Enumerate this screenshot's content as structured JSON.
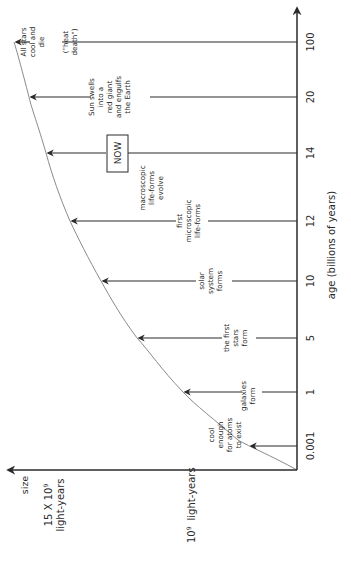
{
  "diagram": {
    "orientation": "rotated-90-ccw",
    "x_axis": {
      "label": "age (billions of years)",
      "ticks": [
        "0.001",
        "1",
        "5",
        "10",
        "12",
        "14",
        "20",
        "100"
      ]
    },
    "y_axis": {
      "label": "size",
      "markers": [
        "15 X 10⁹ light-years",
        "10⁹ light-years"
      ]
    },
    "events": [
      {
        "age": "0.001",
        "lines": [
          "cool",
          "enough",
          "for atoms",
          "to exist"
        ]
      },
      {
        "age": "1",
        "lines": [
          "galaxies",
          "form"
        ]
      },
      {
        "age": "5",
        "lines": [
          "the first",
          "stars",
          "form"
        ]
      },
      {
        "age": "10",
        "lines": [
          "solar",
          "system",
          "forms"
        ]
      },
      {
        "age": "12",
        "lines": [
          "first",
          "microscopic",
          "life-forms"
        ]
      },
      {
        "age": "12-14",
        "lines": [
          "macroscopic",
          "life-forms",
          "evolve"
        ]
      },
      {
        "age": "14",
        "lines": [
          "NOW"
        ]
      },
      {
        "age": "20",
        "lines": [
          "Sun swells",
          "into a",
          "red giant",
          "and engulfs",
          "the Earth"
        ]
      },
      {
        "age": "100",
        "lines": [
          "All stars",
          "cool and",
          "die",
          "(\"heat",
          "death\")"
        ]
      }
    ],
    "size_label": "size",
    "size_15_line1": "15 X 10",
    "size_15_exp": "9",
    "size_15_line2": "light-years",
    "size_10_base": "10",
    "size_10_exp": "9",
    "size_10_unit": "light-years",
    "age_label": "age (billions of years)"
  }
}
